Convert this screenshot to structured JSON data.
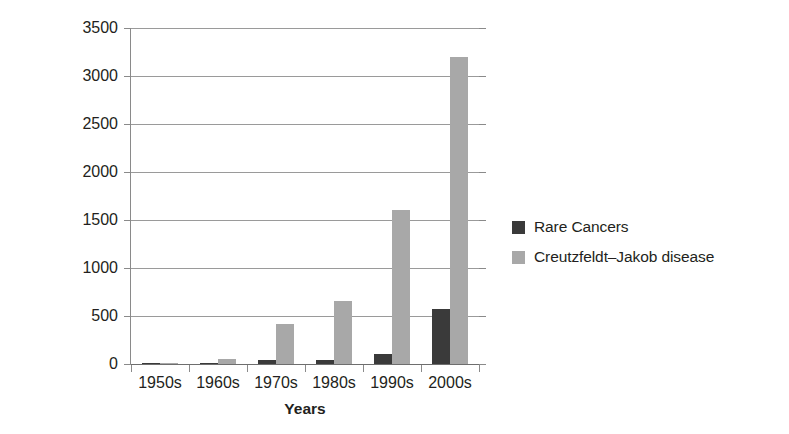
{
  "chart_data": {
    "type": "bar",
    "title": "",
    "xlabel": "Years",
    "ylabel": "Number of Publications",
    "categories": [
      "1950s",
      "1960s",
      "1970s",
      "1980s",
      "1990s",
      "2000s"
    ],
    "series": [
      {
        "name": "Rare Cancers",
        "color": "#3a3a3a",
        "values": [
          5,
          10,
          40,
          45,
          105,
          570
        ]
      },
      {
        "name": "Creutzfeldt–Jakob disease",
        "color": "#a8a8a8",
        "values": [
          10,
          50,
          420,
          660,
          1600,
          3200
        ]
      }
    ],
    "ylim": [
      0,
      3500
    ],
    "yticks": [
      0,
      500,
      1000,
      1500,
      2000,
      2500,
      3000,
      3500
    ],
    "ytick_labels": [
      "0",
      "500",
      "1000",
      "1500",
      "2000",
      "2500",
      "3000",
      "3500"
    ],
    "grid": true,
    "legend_position": "right"
  }
}
